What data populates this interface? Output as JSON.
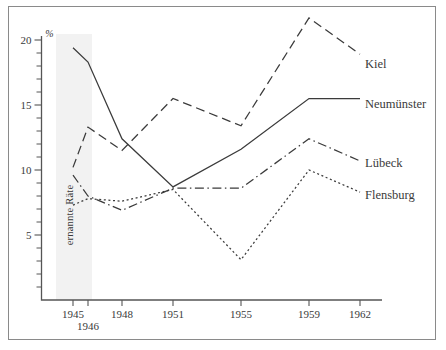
{
  "chart_data": {
    "type": "line",
    "title": "",
    "subtitle": "",
    "xlabel": "",
    "ylabel": "%",
    "y_axis_unit": "%",
    "grid": false,
    "legend_position": "right-inline-labels",
    "x": [
      1945,
      1946,
      1948,
      1951,
      1955,
      1959,
      1962
    ],
    "categories": [
      "1945",
      "1946",
      "1948",
      "1951",
      "1955",
      "1959",
      "1962"
    ],
    "xlim": [
      1944.3,
      1962.6
    ],
    "ylim": [
      0,
      21.8
    ],
    "y_major_ticks": [
      5,
      10,
      15,
      20
    ],
    "y_major_tick_labels": [
      "5",
      "10",
      "15",
      "20"
    ],
    "y_minor_tick_step": 1,
    "x_tick_labels": [
      "1945",
      "1946",
      "1948",
      "1951",
      "1955",
      "1959",
      "1962"
    ],
    "annotation_band": {
      "label": "ernannte Räte",
      "x_start": 1945,
      "x_end": 1946,
      "color": "#f2f2f2",
      "orientation": "vertical"
    },
    "series": [
      {
        "name": "Kiel",
        "style": "dashed",
        "values": [
          10.2,
          13.3,
          11.5,
          15.5,
          13.4,
          21.7,
          18.9
        ]
      },
      {
        "name": "Neumünster",
        "style": "solid",
        "values": [
          19.4,
          18.3,
          12.4,
          8.7,
          11.6,
          15.5,
          15.5
        ]
      },
      {
        "name": "Lübeck",
        "style": "dash-dot",
        "values": [
          9.6,
          8.0,
          6.9,
          8.6,
          8.6,
          12.4,
          10.7
        ]
      },
      {
        "name": "Flensburg",
        "style": "dotted",
        "values": [
          7.3,
          7.8,
          7.6,
          8.5,
          3.1,
          10.0,
          8.3
        ]
      }
    ],
    "series_labels": [
      "Kiel",
      "Neumünster",
      "Lübeck",
      "Flensburg"
    ],
    "colors": {
      "line": "#3b3b3b",
      "axis": "#555555",
      "text": "#3a3a3a",
      "band": "#f2f2f2",
      "frame": "#8a8a8a",
      "background": "#ffffff"
    }
  }
}
